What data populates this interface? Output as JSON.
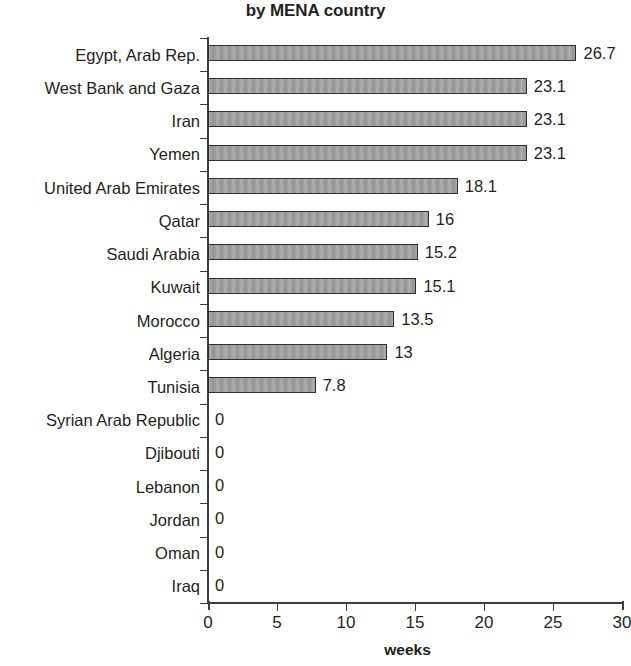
{
  "chart_data": {
    "type": "bar",
    "orientation": "horizontal",
    "title": "by MENA country",
    "xlabel": "weeks",
    "ylabel": "",
    "xlim": [
      0,
      30
    ],
    "xticks": [
      0,
      5,
      10,
      15,
      20,
      25,
      30
    ],
    "grid": false,
    "legend": null,
    "bar_color": "#9b9b9b",
    "bar_outline_color": "#2e2e2e",
    "axis_color": "#3c3c3b",
    "text_color": "#231f20",
    "categories": [
      "Egypt, Arab Rep.",
      "West Bank and Gaza",
      "Iran",
      "Yemen",
      "United Arab Emirates",
      "Qatar",
      "Saudi Arabia",
      "Kuwait",
      "Morocco",
      "Algeria",
      "Tunisia",
      "Syrian Arab Republic",
      "Djibouti",
      "Lebanon",
      "Jordan",
      "Oman",
      "Iraq"
    ],
    "values": [
      26.7,
      23.1,
      23.1,
      23.1,
      18.1,
      16,
      15.2,
      15.1,
      13.5,
      13,
      7.8,
      0,
      0,
      0,
      0,
      0,
      0
    ],
    "value_labels": [
      "26.7",
      "23.1",
      "23.1",
      "23.1",
      "18.1",
      "16",
      "15.2",
      "15.1",
      "13.5",
      "13",
      "7.8",
      "0",
      "0",
      "0",
      "0",
      "0",
      "0"
    ],
    "xtick_labels": [
      "0",
      "5",
      "10",
      "15",
      "20",
      "25",
      "30"
    ]
  }
}
